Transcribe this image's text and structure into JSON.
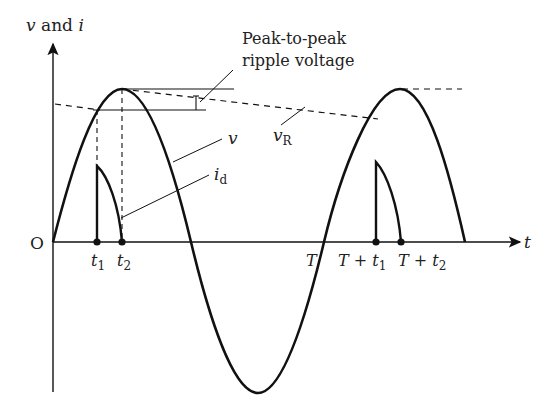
{
  "figure": {
    "type": "half-wave rectifier waveform diagram",
    "y_axis_label": {
      "v": "v",
      "and": " and ",
      "i": "i"
    },
    "x_axis_label": "t",
    "origin_label": "O",
    "annotation": {
      "line1": "Peak-to-peak",
      "line2": "ripple voltage"
    },
    "curve_labels": {
      "v": "v",
      "vR_main": "v",
      "vR_sub": "R",
      "id_main": "i",
      "id_sub": "d"
    },
    "ticks": [
      {
        "main": "t",
        "sub": "1"
      },
      {
        "main": "t",
        "sub": "2"
      },
      {
        "main": "T",
        "sub": ""
      },
      {
        "main": "T + t",
        "sub": "1"
      },
      {
        "main": "T + t",
        "sub": "2"
      }
    ],
    "colors": {
      "ink": "#111111",
      "text": "#222222",
      "background": "#ffffff"
    }
  }
}
